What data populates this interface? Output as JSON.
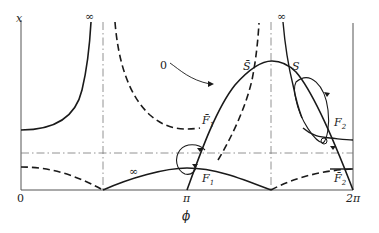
{
  "diagram": {
    "axes": {
      "y_label": "x",
      "x_label": "ϕ",
      "x_ticks": [
        "0",
        "π",
        "2π"
      ],
      "infinity_marks": [
        "∞",
        "∞",
        "∞"
      ]
    },
    "labels": {
      "zero_curve": "0",
      "S_bar": "S̄",
      "S": "S",
      "F1_bar": "F̄",
      "F1_bar_sub": "1",
      "F1": "F",
      "F1_sub": "1",
      "F2": "F",
      "F2_sub": "2",
      "F2_bar": "F̄",
      "F2_bar_sub": "2",
      "inf_low": "∞"
    },
    "colors": {
      "stroke": "#1a1a1a",
      "axis": "#555555",
      "background": "#ffffff"
    }
  }
}
